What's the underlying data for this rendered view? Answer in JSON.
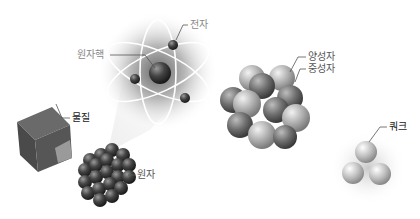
{
  "diagram": {
    "title": "",
    "labels": {
      "electron": "전자",
      "nucleus": "원자핵",
      "matter": "물질",
      "atom": "원자",
      "proton": "양성자",
      "neutron": "중성자",
      "quark": "쿼크"
    },
    "stages": [
      "물질",
      "원자",
      "원자핵",
      "양성자/중성자",
      "쿼크"
    ]
  }
}
